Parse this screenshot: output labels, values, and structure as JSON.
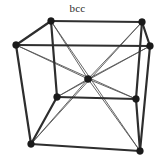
{
  "figure": {
    "title": "bcc",
    "title_full_name": "body-centered cubic",
    "background_color": "#ffffff",
    "width": 155,
    "height": 160
  },
  "style": {
    "edge_color": "#2e2e2e",
    "edge_width": 2.2,
    "diagonal_color": "#555555",
    "diagonal_width": 0.9,
    "atom_color": "#1a1a1a",
    "corner_atom_radius": 3.4,
    "center_atom_radius": 3.6
  },
  "chart_data": {
    "type": "diagram",
    "title": "bcc",
    "atoms": [
      {
        "id": "top-back-left",
        "label": "corner",
        "x": 51,
        "y": 21
      },
      {
        "id": "top-back-right",
        "label": "corner",
        "x": 142,
        "y": 22
      },
      {
        "id": "top-front-left",
        "label": "corner",
        "x": 16,
        "y": 45
      },
      {
        "id": "top-front-right",
        "label": "corner",
        "x": 150,
        "y": 46
      },
      {
        "id": "bottom-back-left",
        "label": "corner",
        "x": 57,
        "y": 97
      },
      {
        "id": "bottom-back-right",
        "label": "corner",
        "x": 136,
        "y": 99
      },
      {
        "id": "bottom-front-left",
        "label": "corner",
        "x": 31,
        "y": 144
      },
      {
        "id": "bottom-front-right",
        "label": "corner",
        "x": 140,
        "y": 151
      },
      {
        "id": "body-center",
        "label": "body-center",
        "x": 88,
        "y": 79
      }
    ],
    "edges": [
      {
        "from": "top-back-left",
        "to": "top-back-right"
      },
      {
        "from": "top-front-left",
        "to": "top-front-right"
      },
      {
        "from": "top-back-left",
        "to": "top-front-left"
      },
      {
        "from": "top-back-right",
        "to": "top-front-right"
      },
      {
        "from": "bottom-back-left",
        "to": "bottom-back-right"
      },
      {
        "from": "bottom-front-left",
        "to": "bottom-front-right"
      },
      {
        "from": "bottom-back-left",
        "to": "bottom-front-left"
      },
      {
        "from": "bottom-back-right",
        "to": "bottom-front-right"
      },
      {
        "from": "top-back-left",
        "to": "bottom-back-left"
      },
      {
        "from": "top-back-right",
        "to": "bottom-back-right"
      },
      {
        "from": "top-front-left",
        "to": "bottom-front-left"
      },
      {
        "from": "top-front-right",
        "to": "bottom-front-right"
      }
    ],
    "body_diagonals": [
      {
        "from": "top-back-left",
        "to": "bottom-front-right"
      },
      {
        "from": "top-back-right",
        "to": "bottom-front-left"
      },
      {
        "from": "top-front-left",
        "to": "bottom-back-right"
      },
      {
        "from": "top-front-right",
        "to": "bottom-back-left"
      }
    ],
    "center_atom_id": "body-center",
    "corner_count": 8,
    "body_center_count": 1,
    "atoms_per_cell": 2
  }
}
